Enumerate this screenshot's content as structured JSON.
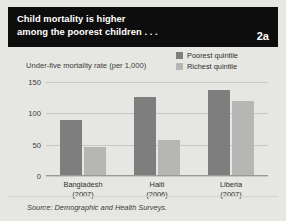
{
  "figure": {
    "number_label": "2a",
    "title_line1": "Child mortality is higher",
    "title_line2": "among the poorest children . . .",
    "subtitle": "Under-five mortality rate (per 1,000)",
    "source": "Source: Demographic and Health Surveys.",
    "colors": {
      "banner_bg": "#0d0d0d",
      "panel_bg": "#e6e6e2",
      "poorest": "#7e7e7e",
      "richest": "#b6b6b4",
      "gridline": "#c9c9c4"
    }
  },
  "chart_data": {
    "type": "bar",
    "title": "Child mortality is higher among the poorest children . . .",
    "subtitle": "Under-five mortality rate (per 1,000)",
    "xlabel": "",
    "ylabel": "Under-five mortality rate (per 1,000)",
    "ylim": [
      0,
      150
    ],
    "yticks": [
      0,
      50,
      100,
      150
    ],
    "ytick_labels": [
      "0",
      "50",
      "100",
      "150"
    ],
    "grid": true,
    "legend_position": "top-right",
    "categories": [
      "Bangladesh\n(2007)",
      "Haiti\n(2006)",
      "Liberia\n(2007)"
    ],
    "category_lines": [
      {
        "name": "Bangladesh",
        "year": "(2007)"
      },
      {
        "name": "Haiti",
        "year": "(2006)"
      },
      {
        "name": "Liberia",
        "year": "(2007)"
      }
    ],
    "series": [
      {
        "name": "Poorest quintile",
        "color": "#7e7e7e",
        "values": [
          88,
          125,
          135
        ]
      },
      {
        "name": "Richest quintile",
        "color": "#b6b6b4",
        "values": [
          44,
          56,
          118
        ]
      }
    ]
  }
}
